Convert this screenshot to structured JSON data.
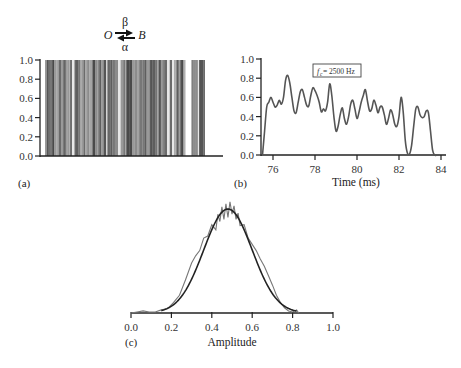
{
  "scheme": {
    "left_state": "O",
    "right_state": "B",
    "forward_rate": "β",
    "backward_rate": "α"
  },
  "chart_data": [
    {
      "id": "a",
      "type": "bar",
      "panel_label": "(a)",
      "title": "",
      "xlabel": "",
      "ylabel": "",
      "ylim": [
        0.0,
        1.0
      ],
      "yticks": [
        "0.0",
        "0.2",
        "0.4",
        "0.6",
        "0.8",
        "1.0"
      ],
      "description": "Binary open/closed trace (values 0 or 1); dense unit-height bars with a closed interval near the end",
      "open_intervals_fraction": [
        [
          0.0,
          0.825
        ],
        [
          0.86,
          0.94
        ]
      ],
      "open_value": 1.0,
      "closed_value": 0.0
    },
    {
      "id": "b",
      "type": "line",
      "panel_label": "(b)",
      "title": "",
      "annotation": "fc = 2500 Hz",
      "annotation_main": "f",
      "annotation_sub": "c",
      "annotation_rest": " = 2500 Hz",
      "xlabel": "Time (ms)",
      "ylabel": "",
      "xlim": [
        75.5,
        84.2
      ],
      "ylim": [
        0.0,
        1.0
      ],
      "xticks": [
        "76",
        "78",
        "80",
        "82",
        "84"
      ],
      "yticks": [
        "0.0",
        "0.2",
        "0.4",
        "0.6",
        "0.8",
        "1.0"
      ],
      "x": [
        75.5,
        75.6,
        75.7,
        75.8,
        75.9,
        76.0,
        76.1,
        76.2,
        76.3,
        76.4,
        76.5,
        76.6,
        76.7,
        76.8,
        76.9,
        77.0,
        77.1,
        77.2,
        77.3,
        77.4,
        77.5,
        77.6,
        77.7,
        77.8,
        77.9,
        78.0,
        78.1,
        78.2,
        78.3,
        78.4,
        78.5,
        78.6,
        78.7,
        78.8,
        78.9,
        79.0,
        79.1,
        79.2,
        79.3,
        79.4,
        79.5,
        79.6,
        79.7,
        79.8,
        79.9,
        80.0,
        80.1,
        80.2,
        80.3,
        80.4,
        80.5,
        80.6,
        80.7,
        80.8,
        80.9,
        81.0,
        81.1,
        81.2,
        81.3,
        81.4,
        81.5,
        81.6,
        81.7,
        81.8,
        81.9,
        82.0,
        82.1,
        82.2,
        82.3,
        82.4,
        82.5,
        82.6,
        82.7,
        82.8,
        82.9,
        83.0,
        83.1,
        83.2,
        83.3,
        83.4,
        83.5,
        83.6,
        83.7,
        83.8,
        83.9
      ],
      "y": [
        0.0,
        0.25,
        0.5,
        0.55,
        0.6,
        0.55,
        0.5,
        0.52,
        0.57,
        0.53,
        0.6,
        0.78,
        0.83,
        0.75,
        0.6,
        0.46,
        0.44,
        0.55,
        0.66,
        0.68,
        0.6,
        0.52,
        0.51,
        0.62,
        0.7,
        0.67,
        0.62,
        0.55,
        0.45,
        0.48,
        0.46,
        0.55,
        0.74,
        0.62,
        0.4,
        0.25,
        0.3,
        0.42,
        0.49,
        0.38,
        0.32,
        0.4,
        0.53,
        0.57,
        0.48,
        0.38,
        0.45,
        0.55,
        0.62,
        0.68,
        0.56,
        0.46,
        0.48,
        0.57,
        0.52,
        0.44,
        0.5,
        0.5,
        0.42,
        0.32,
        0.38,
        0.47,
        0.42,
        0.32,
        0.3,
        0.4,
        0.6,
        0.45,
        0.15,
        0.02,
        0.01,
        0.1,
        0.3,
        0.48,
        0.5,
        0.42,
        0.39,
        0.4,
        0.46,
        0.44,
        0.25,
        0.05,
        0.0,
        0.0,
        0.0
      ]
    },
    {
      "id": "c",
      "type": "line",
      "panel_label": "(c)",
      "title": "",
      "xlabel": "Amplitude",
      "ylabel": "",
      "xlim": [
        0.0,
        1.0
      ],
      "xticks": [
        "0.0",
        "0.2",
        "0.4",
        "0.6",
        "0.8",
        "1.0"
      ],
      "series": [
        {
          "name": "histogram (noisy)",
          "x": [
            0.0,
            0.03,
            0.06,
            0.09,
            0.12,
            0.15,
            0.18,
            0.21,
            0.24,
            0.27,
            0.3,
            0.32,
            0.34,
            0.36,
            0.38,
            0.4,
            0.42,
            0.43,
            0.44,
            0.45,
            0.46,
            0.47,
            0.48,
            0.49,
            0.5,
            0.51,
            0.52,
            0.53,
            0.54,
            0.56,
            0.58,
            0.6,
            0.62,
            0.64,
            0.66,
            0.68,
            0.7,
            0.72,
            0.74,
            0.76,
            0.78,
            0.8,
            0.82,
            0.83
          ],
          "y": [
            0.0,
            0.01,
            0.02,
            0.01,
            0.01,
            0.03,
            0.04,
            0.1,
            0.17,
            0.32,
            0.48,
            0.55,
            0.6,
            0.72,
            0.74,
            0.85,
            0.8,
            0.95,
            0.88,
            1.02,
            0.9,
            1.05,
            0.92,
            1.07,
            0.95,
            1.03,
            0.9,
            0.96,
            0.84,
            0.85,
            0.72,
            0.66,
            0.6,
            0.52,
            0.45,
            0.36,
            0.27,
            0.17,
            0.1,
            0.05,
            0.02,
            0.01,
            0.03,
            0.0
          ]
        },
        {
          "name": "gaussian fit",
          "mean": 0.48,
          "sd": 0.12,
          "peak": 1.0
        }
      ]
    }
  ]
}
